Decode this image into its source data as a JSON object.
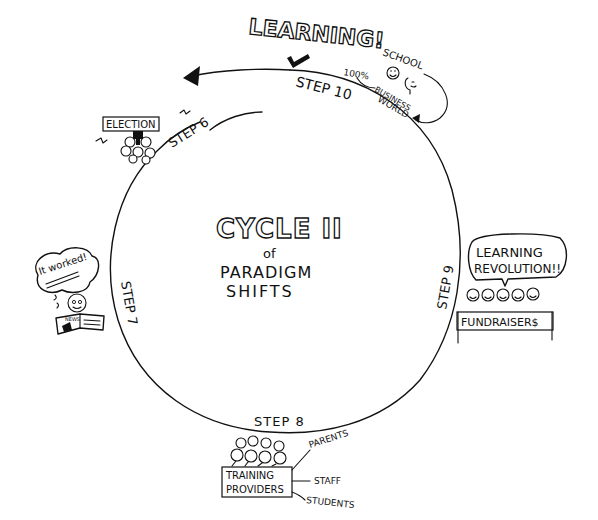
{
  "diagram": {
    "center": {
      "title": "CYCLE II",
      "line2": "of",
      "line3": "PARADIGM",
      "line4": "SHIFTS"
    },
    "steps": [
      {
        "id": "step6",
        "label": "STEP 6"
      },
      {
        "id": "step7",
        "label": "STEP 7"
      },
      {
        "id": "step8",
        "label": "STEP 8"
      },
      {
        "id": "step9",
        "label": "STEP 9"
      },
      {
        "id": "step10",
        "label": "STEP 10"
      }
    ],
    "step10": {
      "headline": "LEARNING!",
      "school": "SCHOOL",
      "percent": "100%",
      "business_line1": "BUSINESS",
      "business_line2": "WORLD"
    },
    "step6": {
      "sign": "ELECTION"
    },
    "step7": {
      "thought": "It worked!",
      "newspaper": "NEWS"
    },
    "step8": {
      "box_line1": "TRAINING",
      "box_line2": "PROVIDERS",
      "labels": [
        "PARENTS",
        "STAFF",
        "STUDENTS"
      ]
    },
    "step9": {
      "speech_line1": "LEARNING",
      "speech_line2": "REVOLUTION!!",
      "banner": "FUNDRAISER$"
    },
    "colors": {
      "ink": "#111111",
      "paper": "#ffffff"
    }
  }
}
